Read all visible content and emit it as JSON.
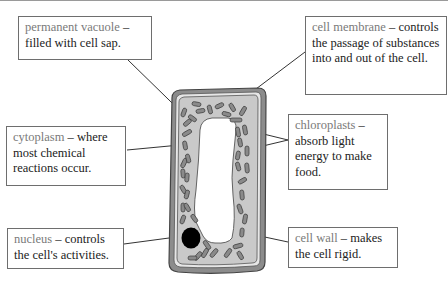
{
  "labels": [
    {
      "id": "permanent-vacuole",
      "term": "permanent vacuole",
      "separator": " – ",
      "description": "filled with cell sap."
    },
    {
      "id": "cell-membrane",
      "term": "cell membrane",
      "separator": " – ",
      "description": "controls the passage of substances into and out of the cell."
    },
    {
      "id": "cytoplasm",
      "term": "cytoplasm",
      "separator": " – ",
      "description": "where most chemical reactions occur."
    },
    {
      "id": "chloroplasts",
      "term": "chloroplasts",
      "separator": " – ",
      "description": "absorb light energy to make food."
    },
    {
      "id": "nucleus",
      "term": "nucleus",
      "separator": " – ",
      "description": "controls the cell's activities."
    },
    {
      "id": "cell-wall",
      "term": "cell wall",
      "separator": " – ",
      "description": "makes the cell rigid."
    }
  ],
  "colors": {
    "term_text": "#7a7a7a",
    "body_text": "#222222",
    "box_border": "#6e6e6e",
    "cell_wall": "#8c8c8c",
    "cytoplasm": "#c9c9c9",
    "chloroplast": "#8a8a8a",
    "nucleus": "#000000",
    "vacuole": "#ffffff"
  }
}
